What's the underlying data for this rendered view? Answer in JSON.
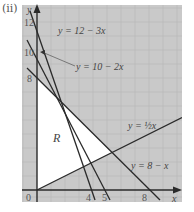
{
  "part_label": "(ii)",
  "axes": {
    "x_label": "x",
    "y_label": "y",
    "origin_label": "0"
  },
  "x_ticks": [
    {
      "label": "4",
      "value": 4
    },
    {
      "label": "5",
      "value": 5
    },
    {
      "label": "8",
      "value": 8
    }
  ],
  "y_ticks": [
    {
      "label": "12",
      "value": 12
    },
    {
      "label": "10",
      "value": 10
    },
    {
      "label": "8",
      "value": 8
    }
  ],
  "lines": [
    {
      "label": "y = 12 − 3x",
      "equation": "y = 12 - 3x"
    },
    {
      "label": "y = 10 − 2x",
      "equation": "y = 10 - 2x"
    },
    {
      "label": "y = ½x",
      "equation": "y = 1/2 x"
    },
    {
      "label": "y = 8 − x",
      "equation": "y = 8 - x"
    }
  ],
  "region_label": "R",
  "colors": {
    "grid_bg": "#c9c9c9",
    "grid_line": "#b3b3b3",
    "line": "#2a2a2a",
    "region": "#ffffff"
  }
}
